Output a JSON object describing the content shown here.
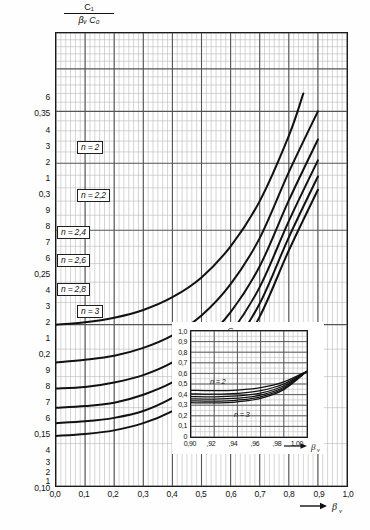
{
  "figure": {
    "domain": "chart",
    "notation": "decimal comma (German)"
  },
  "main_axis": {
    "y_title_numerator": "C₁",
    "y_title_denominator": "βᵥ C₀",
    "x_axis_symbol": "βᵥ",
    "y_tick_labels": [
      "6",
      "0,35",
      "4",
      "3",
      "2",
      "1",
      "0,3",
      "9",
      "8",
      "7",
      "6",
      "0,25",
      "4",
      "3",
      "2",
      "1",
      "0,2",
      "9",
      "8",
      "7",
      "6",
      "0,15",
      "4",
      "3",
      "2",
      "1",
      "0,10"
    ],
    "x_tick_labels": [
      "0,0",
      "0,1",
      "0,2",
      "0,3",
      "0,4",
      "0,5",
      "0,6",
      "0,7",
      "0,8",
      "0,9",
      "1,0"
    ]
  },
  "curve_labels": [
    {
      "text": "n = 2"
    },
    {
      "text": "n = 2,2"
    },
    {
      "text": "n = 2,4"
    },
    {
      "text": "n = 2,6"
    },
    {
      "text": "n = 2,8"
    },
    {
      "text": "n = 3"
    }
  ],
  "inset": {
    "y_title_numerator": "C₁",
    "y_title_denominator": "βᵥ C₀",
    "x_axis_symbol": "βᵥ",
    "y_tick_labels": [
      "1,0",
      "0,9",
      "0,8",
      "0,7",
      "0,6",
      "0,5",
      "0,4",
      "0,3",
      "0,2",
      "0,1",
      "0"
    ],
    "x_tick_labels": [
      "0,90",
      ",92",
      ",94",
      ",96",
      ",98",
      "1,00"
    ],
    "curve_label_top": "n = 2",
    "curve_label_bottom": "n = 3"
  },
  "chart_data": {
    "type": "line",
    "title": "",
    "xlabel": "βᵥ",
    "ylabel": "C₁ / (βᵥ C₀)",
    "x_scale": "linear",
    "y_scale": "log",
    "xlim": [
      0.0,
      1.0
    ],
    "ylim": [
      0.1,
      0.7
    ],
    "grid": true,
    "legend": "inline curve labels",
    "series": [
      {
        "name": "n = 2",
        "x": [
          0.0,
          0.1,
          0.2,
          0.3,
          0.4,
          0.5,
          0.6,
          0.7,
          0.8,
          0.85
        ],
        "values": [
          0.2,
          0.202,
          0.206,
          0.213,
          0.225,
          0.245,
          0.28,
          0.34,
          0.45,
          0.54
        ]
      },
      {
        "name": "n = 2,2",
        "x": [
          0.0,
          0.1,
          0.2,
          0.3,
          0.4,
          0.5,
          0.6,
          0.7,
          0.8,
          0.9
        ],
        "values": [
          0.17,
          0.172,
          0.175,
          0.181,
          0.191,
          0.208,
          0.238,
          0.29,
          0.385,
          0.5
        ]
      },
      {
        "name": "n = 2,4",
        "x": [
          0.0,
          0.1,
          0.2,
          0.3,
          0.4,
          0.5,
          0.6,
          0.7,
          0.8,
          0.9
        ],
        "values": [
          0.152,
          0.153,
          0.156,
          0.161,
          0.17,
          0.185,
          0.211,
          0.257,
          0.341,
          0.443
        ]
      },
      {
        "name": "n = 2,6",
        "x": [
          0.0,
          0.1,
          0.2,
          0.3,
          0.4,
          0.5,
          0.6,
          0.7,
          0.8,
          0.9
        ],
        "values": [
          0.14,
          0.141,
          0.143,
          0.148,
          0.156,
          0.169,
          0.193,
          0.235,
          0.312,
          0.405
        ]
      },
      {
        "name": "n = 2,8",
        "x": [
          0.0,
          0.1,
          0.2,
          0.3,
          0.4,
          0.5,
          0.6,
          0.7,
          0.8,
          0.9
        ],
        "values": [
          0.131,
          0.132,
          0.134,
          0.138,
          0.146,
          0.158,
          0.18,
          0.219,
          0.291,
          0.378
        ]
      },
      {
        "name": "n = 3",
        "x": [
          0.0,
          0.1,
          0.2,
          0.3,
          0.4,
          0.5,
          0.6,
          0.7,
          0.8,
          0.9
        ],
        "values": [
          0.124,
          0.125,
          0.127,
          0.131,
          0.138,
          0.149,
          0.17,
          0.207,
          0.275,
          0.357
        ]
      }
    ],
    "inset_chart": {
      "type": "line",
      "xlabel": "βᵥ",
      "ylabel": "C₁ / (βᵥ C₀)",
      "x_scale": "linear",
      "y_scale": "linear",
      "xlim": [
        0.9,
        1.0
      ],
      "ylim": [
        0.0,
        1.0
      ],
      "grid": true,
      "series": [
        {
          "name": "n = 2",
          "x": [
            0.9,
            0.92,
            0.94,
            0.96,
            0.98,
            1.0
          ],
          "values": [
            0.44,
            0.437,
            0.443,
            0.465,
            0.52,
            0.62
          ]
        },
        {
          "name": "n = 2,2",
          "x": [
            0.9,
            0.92,
            0.94,
            0.96,
            0.98,
            1.0
          ],
          "values": [
            0.408,
            0.405,
            0.412,
            0.437,
            0.5,
            0.62
          ]
        },
        {
          "name": "n = 2,4",
          "x": [
            0.9,
            0.92,
            0.94,
            0.96,
            0.98,
            1.0
          ],
          "values": [
            0.382,
            0.379,
            0.387,
            0.414,
            0.483,
            0.62
          ]
        },
        {
          "name": "n = 2,6",
          "x": [
            0.9,
            0.92,
            0.94,
            0.96,
            0.98,
            1.0
          ],
          "values": [
            0.36,
            0.357,
            0.366,
            0.395,
            0.469,
            0.62
          ]
        },
        {
          "name": "n = 2,8",
          "x": [
            0.9,
            0.92,
            0.94,
            0.96,
            0.98,
            1.0
          ],
          "values": [
            0.341,
            0.338,
            0.348,
            0.379,
            0.457,
            0.62
          ]
        },
        {
          "name": "n = 3",
          "x": [
            0.9,
            0.92,
            0.94,
            0.96,
            0.98,
            1.0
          ],
          "values": [
            0.324,
            0.321,
            0.332,
            0.365,
            0.447,
            0.62
          ]
        }
      ]
    }
  }
}
